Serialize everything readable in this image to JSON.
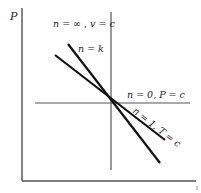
{
  "diagram": {
    "axis": {
      "y_label": "P",
      "x_label": ""
    },
    "colors": {
      "line": "#111111",
      "axis": "#333333",
      "reference": "#555555",
      "background": "#ffffff"
    },
    "curves": [
      {
        "id": "n-inf",
        "label_n": "n = ∞",
        "label_sep": " , ",
        "label_cond": "v = c",
        "description": "vertical line (isochoric)"
      },
      {
        "id": "n-k",
        "label": "n = k",
        "description": "steeper descending line (isentropic)"
      },
      {
        "id": "n-0",
        "label": "n = 0, P = c",
        "description": "horizontal line (isobaric)"
      },
      {
        "id": "n-1",
        "label": "n = 1, T = c",
        "description": "shallower descending line (isothermal)"
      }
    ],
    "corner_mark": "i"
  }
}
